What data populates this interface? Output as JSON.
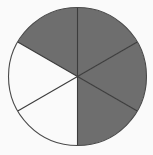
{
  "figure": {
    "background_color": "#fafafa"
  },
  "chart_data": {
    "type": "pie",
    "title": "",
    "subtitle": "",
    "xlabel": "",
    "ylabel": "",
    "legend": [],
    "annotations": [],
    "grid": false,
    "total_sectors": 6,
    "shaded_sectors": 4,
    "unshaded_sectors": 2,
    "fraction_shaded": "4/6",
    "sector_angle_degrees": 60,
    "start_angle_degrees": 0,
    "categories": [
      "sector-1",
      "sector-2",
      "sector-3",
      "sector-4",
      "sector-5",
      "sector-6"
    ],
    "values": [
      60,
      60,
      60,
      60,
      60,
      60
    ],
    "series": [
      {
        "name": "sectors",
        "values": [
          60,
          60,
          60,
          60,
          60,
          60
        ],
        "fills": [
          "#6e6e6e",
          "#6e6e6e",
          "#6e6e6e",
          "#fafafa",
          "#fafafa",
          "#6e6e6e"
        ],
        "states": [
          "shaded",
          "shaded",
          "shaded",
          "unshaded",
          "unshaded",
          "shaded"
        ]
      }
    ],
    "geometry": {
      "center_x": 77.5,
      "center_y": 76.5,
      "radius": 69
    },
    "colors": {
      "shaded_fill": "#6e6e6e",
      "unshaded_fill": "#fafafa",
      "outline": "#4a4a4a",
      "divider": "#3c3c3c"
    }
  }
}
